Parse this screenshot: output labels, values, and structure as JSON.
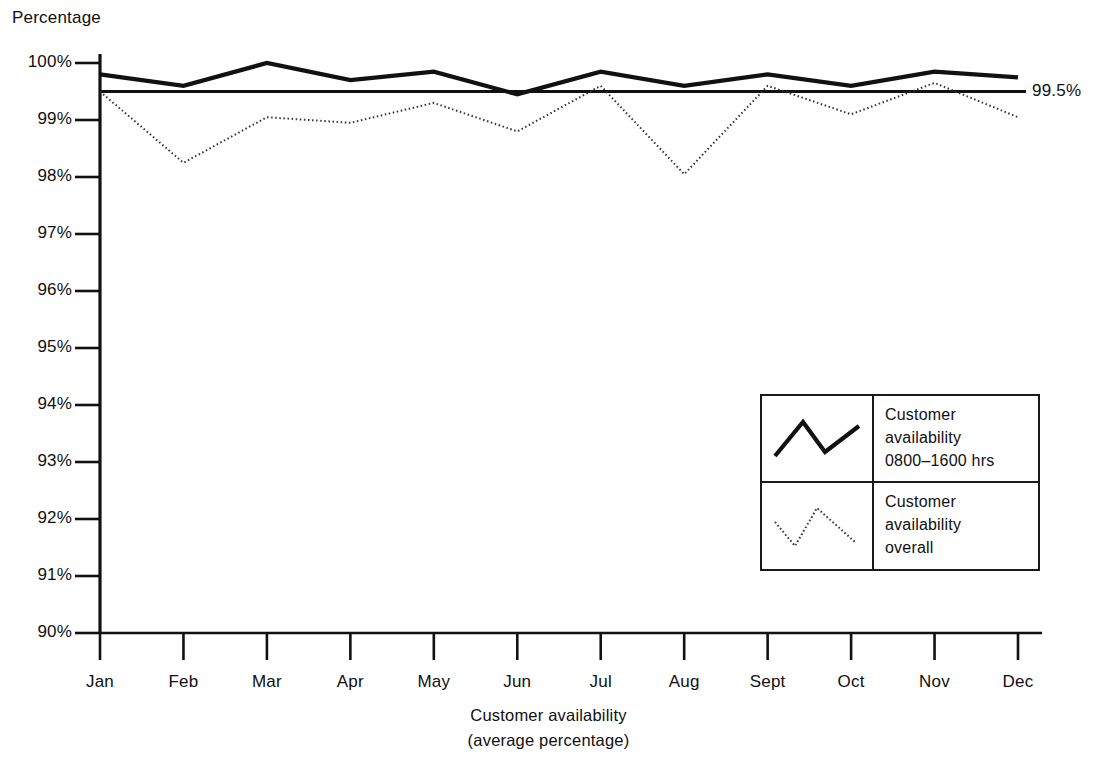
{
  "chart_data": {
    "type": "line",
    "title": "",
    "ylabel": "Percentage",
    "xlabel": "Customer availability\n(average percentage)",
    "xlabel_line1": "Customer availability",
    "xlabel_line2": "(average percentage)",
    "categories": [
      "Jan",
      "Feb",
      "Mar",
      "Apr",
      "May",
      "Jun",
      "Jul",
      "Aug",
      "Sept",
      "Oct",
      "Nov",
      "Dec"
    ],
    "ylim": [
      90,
      100
    ],
    "ytick_labels": [
      "100%",
      "99%",
      "98%",
      "97%",
      "96%",
      "95%",
      "94%",
      "93%",
      "92%",
      "91%",
      "90%"
    ],
    "ytick_values": [
      100,
      99,
      98,
      97,
      96,
      95,
      94,
      93,
      92,
      91,
      90
    ],
    "grid": false,
    "legend_position": "inside-bottom-right",
    "series": [
      {
        "name": "Customer availability 0800-1600 hrs",
        "style": "solid",
        "color": "#111111",
        "values": [
          99.8,
          99.6,
          100.0,
          99.7,
          99.85,
          99.45,
          99.85,
          99.6,
          99.8,
          99.6,
          99.85,
          99.75
        ]
      },
      {
        "name": "Customer availability overall",
        "style": "dotted",
        "color": "#333333",
        "values": [
          99.5,
          98.25,
          99.05,
          98.95,
          99.3,
          98.8,
          99.6,
          98.05,
          99.6,
          99.1,
          99.65,
          99.05
        ]
      }
    ],
    "reference_line": {
      "value": 99.5,
      "label": "99.5%",
      "style": "solid",
      "color": "#111111"
    }
  },
  "legend": {
    "entries": [
      {
        "swatch": "solid-zigzag-line",
        "line1": "Customer",
        "line2": "availability",
        "line3": "0800–1600 hrs"
      },
      {
        "swatch": "dotted-zigzag-line",
        "line1": "Customer",
        "line2": "availability",
        "line3": "overall"
      }
    ]
  }
}
